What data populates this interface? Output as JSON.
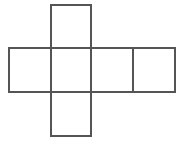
{
  "figure": {
    "name": "cube-net-cross",
    "background_color": "#ffffff",
    "stroke_color": "#555555",
    "stroke_width": 1.5,
    "canvas": {
      "width": 187,
      "height": 145
    },
    "grid": {
      "cell_width": 42,
      "cell_height": 44,
      "x_lines": [
        9,
        51,
        91,
        133,
        175
      ],
      "y_lines": [
        5,
        48,
        92,
        136
      ]
    },
    "squares": [
      {
        "id": "top",
        "label": "",
        "x": 51,
        "y": 5,
        "width": 40,
        "height": 43
      },
      {
        "id": "middle-left",
        "label": "",
        "x": 9,
        "y": 48,
        "width": 42,
        "height": 44
      },
      {
        "id": "middle-center",
        "label": "",
        "x": 51,
        "y": 48,
        "width": 40,
        "height": 44
      },
      {
        "id": "middle-right",
        "label": "",
        "x": 91,
        "y": 48,
        "width": 42,
        "height": 44
      },
      {
        "id": "far-right",
        "label": "",
        "x": 133,
        "y": 48,
        "width": 42,
        "height": 44
      },
      {
        "id": "bottom",
        "label": "",
        "x": 51,
        "y": 92,
        "width": 40,
        "height": 44
      }
    ],
    "segments": [
      {
        "id": "top-square-top",
        "x1": 51,
        "y1": 5,
        "x2": 91,
        "y2": 5
      },
      {
        "id": "top-square-left",
        "x1": 51,
        "y1": 5,
        "x2": 51,
        "y2": 48
      },
      {
        "id": "top-square-right",
        "x1": 91,
        "y1": 5,
        "x2": 91,
        "y2": 48
      },
      {
        "id": "middle-row-top",
        "x1": 9,
        "y1": 48,
        "x2": 175,
        "y2": 48
      },
      {
        "id": "middle-row-bottom",
        "x1": 9,
        "y1": 92,
        "x2": 175,
        "y2": 92
      },
      {
        "id": "divider-x9",
        "x1": 9,
        "y1": 48,
        "x2": 9,
        "y2": 92
      },
      {
        "id": "divider-x51",
        "x1": 51,
        "y1": 48,
        "x2": 51,
        "y2": 92
      },
      {
        "id": "divider-x91",
        "x1": 91,
        "y1": 48,
        "x2": 91,
        "y2": 92
      },
      {
        "id": "divider-x133",
        "x1": 133,
        "y1": 48,
        "x2": 133,
        "y2": 92
      },
      {
        "id": "divider-x175",
        "x1": 175,
        "y1": 48,
        "x2": 175,
        "y2": 92
      },
      {
        "id": "bottom-square-left",
        "x1": 51,
        "y1": 92,
        "x2": 51,
        "y2": 136
      },
      {
        "id": "bottom-square-right",
        "x1": 91,
        "y1": 92,
        "x2": 91,
        "y2": 136
      },
      {
        "id": "bottom-square-bottom",
        "x1": 51,
        "y1": 136,
        "x2": 91,
        "y2": 136
      }
    ]
  }
}
